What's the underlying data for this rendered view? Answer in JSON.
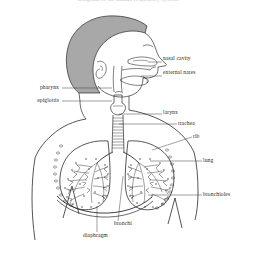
{
  "figure": {
    "title_sliver": "Diagram of the human respiratory system",
    "background_color": "#ffffff",
    "line_color": "#2b2b2b",
    "hair_fill_color": "#a8a8a8",
    "label_text_color": "#2b2b2b"
  },
  "labels": {
    "nasal_cavity": "nasal cavity",
    "external_nares": "external nares",
    "pharynx": "pharynx",
    "epiglottis": "epiglottis",
    "larynx": "larynx",
    "trachea": "trachea",
    "rib": "rib",
    "lung": "lung",
    "bronchioles": "bronchioles",
    "bronchi": "bronchi",
    "diaphragm": "diaphragm"
  },
  "parts": [
    {
      "id": "nasal-cavity",
      "label": "nasal cavity",
      "side": "right",
      "label_x": 163,
      "label_y": 59,
      "leader": [
        148,
        62,
        162,
        62
      ]
    },
    {
      "id": "external-nares",
      "label": "external nares",
      "side": "right",
      "label_x": 163,
      "label_y": 73,
      "leader": [
        141,
        76,
        162,
        76
      ]
    },
    {
      "id": "pharynx",
      "label": "pharynx",
      "side": "left",
      "label_x": 36,
      "label_y": 85,
      "leader": [
        62,
        88,
        112,
        88
      ]
    },
    {
      "id": "epiglottis",
      "label": "epiglottis",
      "side": "left",
      "label_x": 31,
      "label_y": 99,
      "leader": [
        62,
        101,
        112,
        101
      ]
    },
    {
      "id": "larynx",
      "label": "larynx",
      "side": "right",
      "label_x": 163,
      "label_y": 113,
      "leader": [
        119,
        114,
        162,
        114
      ]
    },
    {
      "id": "trachea",
      "label": "trachea",
      "side": "right",
      "label_x": 178,
      "label_y": 126,
      "leader": [
        119,
        124,
        177,
        124
      ]
    },
    {
      "id": "rib",
      "label": "rib",
      "side": "right",
      "label_x": 193,
      "label_y": 139,
      "leader": [
        152,
        150,
        192,
        137
      ]
    },
    {
      "id": "lung",
      "label": "lung",
      "side": "right",
      "label_x": 203,
      "label_y": 159,
      "leader": [
        150,
        161,
        202,
        161
      ]
    },
    {
      "id": "bronchioles",
      "label": "bronchioles",
      "side": "right",
      "label_x": 203,
      "label_y": 193,
      "leader": [
        148,
        195,
        202,
        195
      ]
    },
    {
      "id": "bronchi",
      "label": "bronchi",
      "side": "bottom",
      "label_x": 114,
      "label_y": 224,
      "leader": [
        123,
        176,
        118,
        221
      ]
    },
    {
      "id": "diaphragm",
      "label": "diaphragm",
      "side": "bottom",
      "label_x": 83,
      "label_y": 236,
      "leader": [
        97,
        206,
        97,
        232
      ]
    }
  ]
}
